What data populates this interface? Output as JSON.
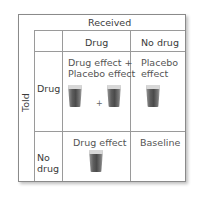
{
  "top_header": "Received",
  "side_header": "Told",
  "columns": [
    "Drug",
    "No drug"
  ],
  "rows": [
    {
      "label": "Drug",
      "cells": [
        {
          "text_line1": "Drug effect +",
          "text_line2": "Placebo effect",
          "glasses": 2,
          "plus": "+"
        },
        {
          "text_line1": "Placebo",
          "text_line2": "effect",
          "glasses": 1
        }
      ]
    },
    {
      "label_line1": "No",
      "label_line2": "drug",
      "cells": [
        {
          "text_line1": "Drug effect",
          "glasses": 1
        },
        {
          "text_line1": "Baseline",
          "glasses": 0
        }
      ]
    }
  ],
  "colors": {
    "border": "#8a8a8a",
    "text": "#3a3a3a",
    "glass": "#5e5e5e"
  }
}
